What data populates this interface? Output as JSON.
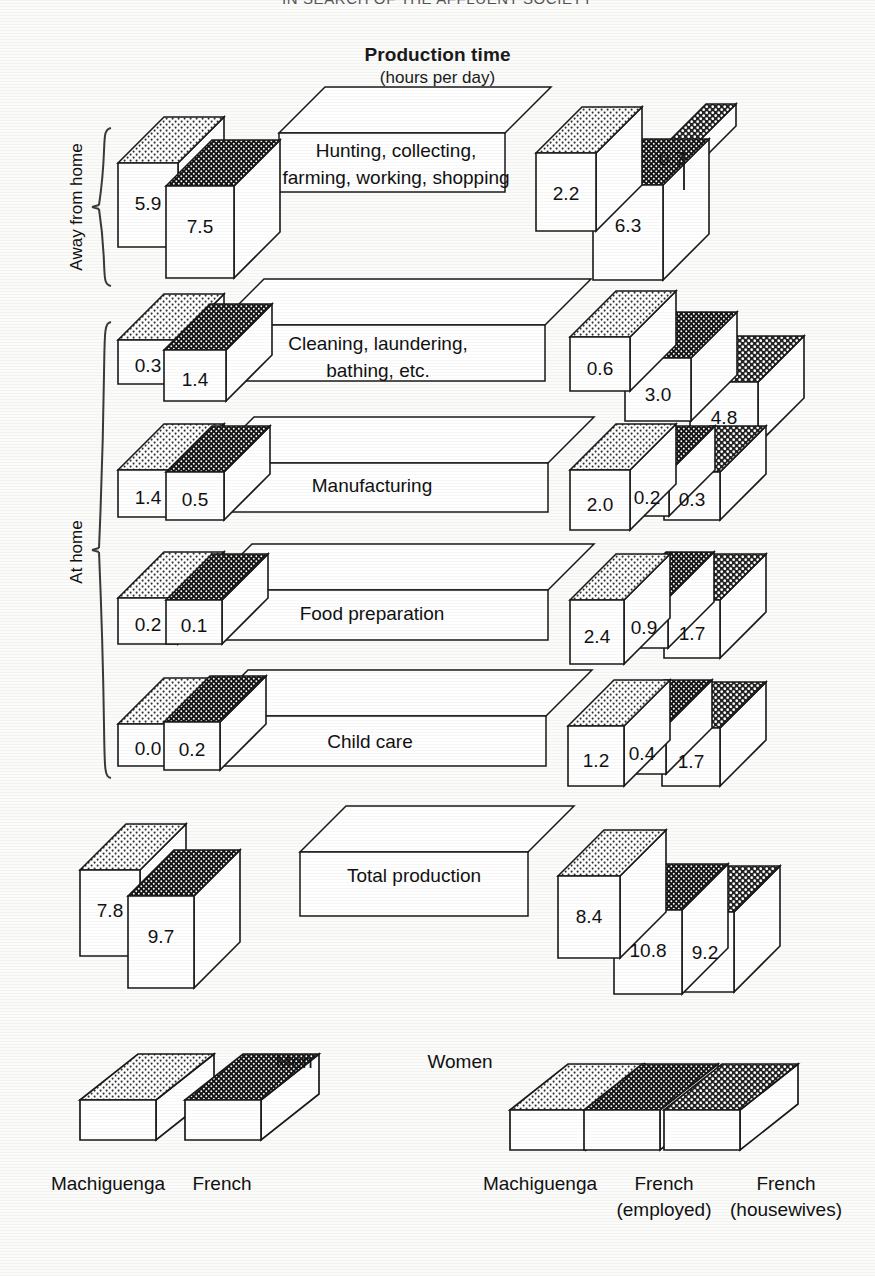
{
  "page": {
    "running_head": "IN SEARCH OF THE AFFLUENT SOCIETY"
  },
  "title": {
    "main": "Production time",
    "sub": "(hours per day)"
  },
  "axis_groups": [
    {
      "label": "Away from home"
    },
    {
      "label": "At home"
    }
  ],
  "legend": {
    "men_heading": "Men",
    "women_heading": "Women",
    "men_items": [
      {
        "label": "Machiguenga",
        "pattern": "light-dots"
      },
      {
        "label": "French",
        "pattern": "dark-dots"
      }
    ],
    "women_items": [
      {
        "label": "Machiguenga",
        "label2": "",
        "pattern": "light-dots"
      },
      {
        "label": "French",
        "label2": "(employed)",
        "pattern": "dark-dots"
      },
      {
        "label": "French",
        "label2": "(housewives)",
        "pattern": "mid-dots"
      }
    ]
  },
  "chart_data": {
    "type": "bar",
    "title": "Production time",
    "subtitle": "(hours per day)",
    "ylabel": "hours per day",
    "xlabel": "",
    "grid": false,
    "legend_position": "bottom",
    "units": "hours per day",
    "series": [
      {
        "name": "Men — Machiguenga",
        "pattern": "light-dots"
      },
      {
        "name": "Men — French",
        "pattern": "dark-dots"
      },
      {
        "name": "Women — Machiguenga",
        "pattern": "light-dots"
      },
      {
        "name": "Women — French (employed)",
        "pattern": "dark-dots"
      },
      {
        "name": "Women — French (housewives)",
        "pattern": "mid-dots"
      }
    ],
    "categories": [
      "Hunting, collecting, farming, working, shopping",
      "Cleaning, laundering, bathing, etc.",
      "Manufacturing",
      "Food preparation",
      "Child care",
      "Total production"
    ],
    "rows": [
      {
        "category": "Hunting, collecting, farming, working, shopping",
        "category_lines": [
          "Hunting, collecting,",
          "farming, working, shopping"
        ],
        "group": "Away from home",
        "men": [
          5.9,
          7.5
        ],
        "women": [
          2.2,
          6.3,
          0.7
        ]
      },
      {
        "category": "Cleaning, laundering, bathing, etc.",
        "category_lines": [
          "Cleaning, laundering,",
          "bathing, etc."
        ],
        "group": "At home",
        "men": [
          0.3,
          1.4
        ],
        "women": [
          0.6,
          3.0,
          4.8
        ]
      },
      {
        "category": "Manufacturing",
        "category_lines": [
          "Manufacturing"
        ],
        "group": "At home",
        "men": [
          1.4,
          0.5
        ],
        "women": [
          2.0,
          0.2,
          0.3
        ]
      },
      {
        "category": "Food preparation",
        "category_lines": [
          "Food preparation"
        ],
        "group": "At home",
        "men": [
          0.2,
          0.1
        ],
        "women": [
          2.4,
          0.9,
          1.7
        ]
      },
      {
        "category": "Child care",
        "category_lines": [
          "Child care"
        ],
        "group": "At home",
        "men": [
          0.0,
          0.2
        ],
        "women": [
          1.2,
          0.4,
          1.7
        ]
      },
      {
        "category": "Total production",
        "category_lines": [
          "Total production"
        ],
        "group": "",
        "men": [
          7.8,
          9.7
        ],
        "women": [
          8.4,
          10.8,
          9.2
        ]
      }
    ],
    "labels": {
      "r0": {
        "m0": "5.9",
        "m1": "7.5",
        "w0": "2.2",
        "w1": "6.3",
        "w2": "0.7"
      },
      "r1": {
        "m0": "0.3",
        "m1": "1.4",
        "w0": "0.6",
        "w1": "3.0",
        "w2": "4.8"
      },
      "r2": {
        "m0": "1.4",
        "m1": "0.5",
        "w0": "2.0",
        "w1": "0.2",
        "w2": "0.3"
      },
      "r3": {
        "m0": "0.2",
        "m1": "0.1",
        "w0": "2.4",
        "w1": "0.9",
        "w2": "1.7"
      },
      "r4": {
        "m0": "0.0",
        "m1": "0.2",
        "w0": "1.2",
        "w1": "0.4",
        "w2": "1.7"
      },
      "r5": {
        "m0": "7.8",
        "m1": "9.7",
        "w0": "8.4",
        "w1": "10.8",
        "w2": "9.2"
      }
    }
  },
  "colors": {
    "stroke": "#1a1a1a",
    "face": "#ffffff",
    "light_dots_bg": "#ffffff",
    "light_dots_fg": "#3a3a3a",
    "dark_dots_bg": "#1c1c1c",
    "dark_dots_fg": "#ffffff",
    "mid_dots_bg": "#2b2b2b",
    "mid_dots_fg": "#ffffff",
    "page_bg": "#fbfbfa"
  }
}
